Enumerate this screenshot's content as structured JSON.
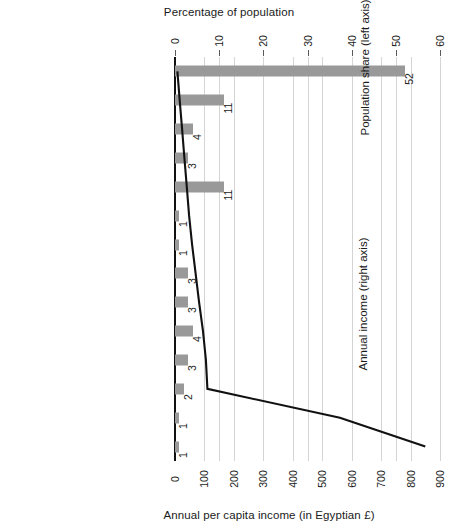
{
  "chart_data": {
    "type": "bar",
    "title": "Percentage of population",
    "xlabel": "Annual per capita income (in Egyptian £)",
    "ylabel": "",
    "orientation": "horizontal",
    "grid": true,
    "legend_position": "inside-plot",
    "categories": [
      "Landless peasants",
      "Urban unemployed",
      "Own less than 1 feddan",
      "Domestic employees",
      "Own 1–5 feddans",
      "Under-proletariat",
      "Traditional wage earners",
      "Proletariat",
      "Own 5–20 feddans",
      "Low-level salaried workers",
      "Entrepreneurs/trade",
      "Middle-level salaried",
      "Own more than 20 feddans",
      "Bourgeoisie"
    ],
    "series": [
      {
        "name": "Population share (left axis)",
        "type": "bar",
        "axis": "top",
        "unit": "%",
        "color": "#999999",
        "values": [
          52,
          11,
          4,
          3,
          11,
          1,
          1,
          3,
          3,
          4,
          3,
          2,
          1,
          1
        ]
      },
      {
        "name": "Annual income (right axis)",
        "type": "line",
        "axis": "bottom",
        "unit": "Egyptian £",
        "color": "#111111",
        "values": [
          8,
          16,
          24,
          32,
          40,
          48,
          58,
          70,
          82,
          95,
          105,
          110,
          560,
          850
        ]
      }
    ],
    "top_axis": {
      "label": "Percentage of population",
      "min": 0,
      "max": 60,
      "ticks": [
        "0",
        "10",
        "20",
        "30",
        "40",
        "50",
        "60"
      ]
    },
    "bottom_axis": {
      "label": "Annual per capita income (in Egyptian £)",
      "min": 0,
      "max": 900,
      "ticks": [
        "0",
        "100",
        "200",
        "300",
        "400",
        "500",
        "600",
        "700",
        "800",
        "900"
      ]
    },
    "annotations": [
      {
        "name": "population-share-legend",
        "line1": "Population share",
        "line2": "(left axis)"
      },
      {
        "name": "annual-income-legend",
        "line1": "Annual income",
        "line2": "(right axis)"
      }
    ],
    "colors": {
      "bar": "#999999",
      "line": "#111111",
      "grid": "#d4d4d4",
      "axis": "#111111"
    }
  }
}
